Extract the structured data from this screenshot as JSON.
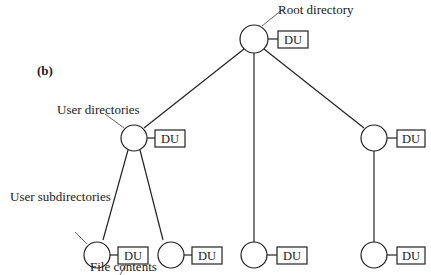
{
  "figure": {
    "panel_label": "(b)",
    "labels": {
      "root": "Root directory",
      "user_dirs": "User directories",
      "user_subdirs": "User subdirectories",
      "file_contents": "File contents"
    },
    "node_tag": "DU",
    "nodes": [
      {
        "id": "root",
        "level": 0,
        "tag": "DU"
      },
      {
        "id": "user1",
        "level": 1,
        "tag": "DU"
      },
      {
        "id": "sub1a",
        "level": 2,
        "tag": "DU"
      },
      {
        "id": "sub1b",
        "level": 2,
        "tag": "DU"
      },
      {
        "id": "user2",
        "level": 2,
        "tag": "DU"
      },
      {
        "id": "user3",
        "level": 1,
        "tag": "DU"
      },
      {
        "id": "sub3a",
        "level": 2,
        "tag": "DU"
      }
    ],
    "edges": [
      [
        "root",
        "user1"
      ],
      [
        "root",
        "user2"
      ],
      [
        "root",
        "user3"
      ],
      [
        "user1",
        "sub1a"
      ],
      [
        "user1",
        "sub1b"
      ],
      [
        "user3",
        "sub3a"
      ]
    ]
  }
}
